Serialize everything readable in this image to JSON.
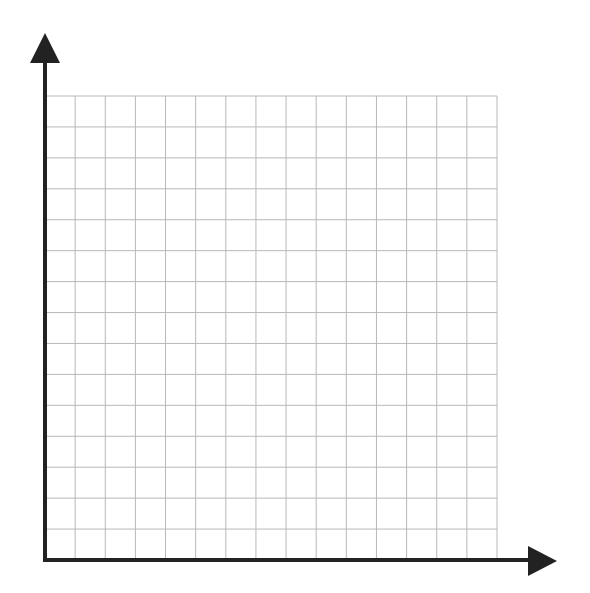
{
  "diagram": {
    "type": "blank-coordinate-grid",
    "quadrant": "first",
    "grid": {
      "columns": 15,
      "rows": 15,
      "left": 45,
      "top": 96,
      "right": 497,
      "bottom": 560,
      "line_color": "#b8b8b8"
    },
    "axes": {
      "color": "#222222",
      "origin": [
        45,
        560
      ],
      "y_axis": {
        "arrow_tip": [
          45,
          33
        ],
        "arrow_base_y": 63,
        "arrow_half_width": 15
      },
      "x_axis": {
        "arrow_tip": [
          557,
          561
        ],
        "arrow_base_x": 528,
        "arrow_half_height": 15
      },
      "stroke_width": 4
    },
    "labels": []
  }
}
